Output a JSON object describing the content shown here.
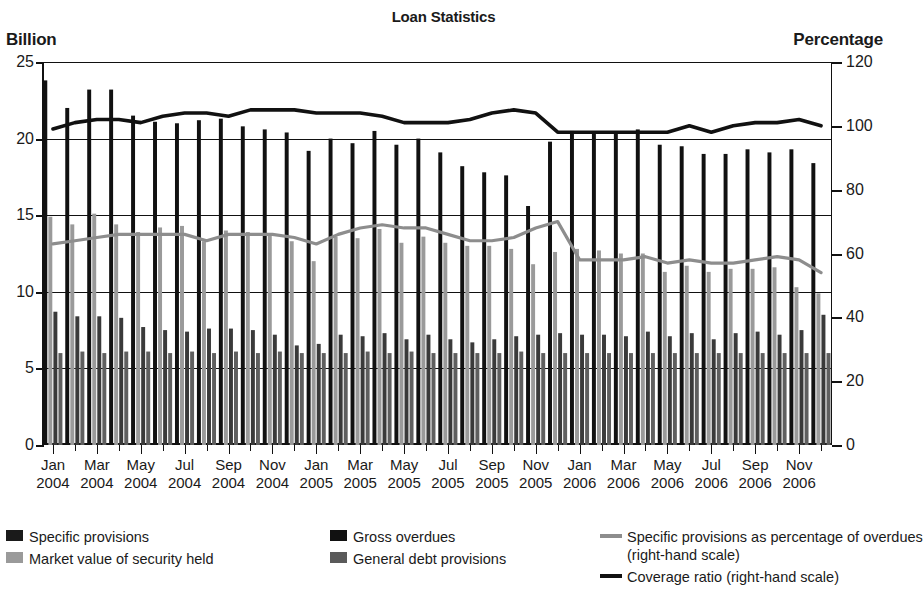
{
  "chart_title": "Loan Statistics",
  "axis_left_title": "Billion",
  "axis_right_title": "Percentage",
  "legend": {
    "items": [
      {
        "name": "specific-provisions",
        "label": "Specific provisions",
        "color": "#1a1a1a",
        "type": "swatch"
      },
      {
        "name": "market-value",
        "label": "Market value of security held",
        "color": "#9a9a9a",
        "type": "swatch"
      },
      {
        "name": "gross-overdues",
        "label": "Gross overdues",
        "color": "#111111",
        "type": "swatch"
      },
      {
        "name": "general-debt-provisions",
        "label": "General debt provisions",
        "color": "#5a5a5a",
        "type": "swatch"
      },
      {
        "name": "specific-pct-overdues",
        "label": "Specific provisions as percentage of overdues",
        "sub": "(right-hand scale)",
        "color": "#8d8d8d",
        "type": "line"
      },
      {
        "name": "coverage-ratio",
        "label": "Coverage ratio (right-hand scale)",
        "color": "#111111",
        "type": "line"
      }
    ]
  },
  "chart_data": {
    "type": "bar",
    "title": "Loan Statistics",
    "xlabel": "",
    "ylabel": "Billion",
    "y2label": "Percentage",
    "ylim": [
      0,
      25
    ],
    "y2lim": [
      0,
      120
    ],
    "yticks": [
      0,
      5,
      10,
      15,
      20,
      25
    ],
    "y2ticks": [
      0,
      20,
      40,
      60,
      80,
      100,
      120
    ],
    "grid": true,
    "legend_position": "below",
    "categories": [
      "Jan 2004",
      "Feb 2004",
      "Mar 2004",
      "Apr 2004",
      "May 2004",
      "Jun 2004",
      "Jul 2004",
      "Aug 2004",
      "Sep 2004",
      "Oct 2004",
      "Nov 2004",
      "Dec 2004",
      "Jan 2005",
      "Feb 2005",
      "Mar 2005",
      "Apr 2005",
      "May 2005",
      "Jun 2005",
      "Jul 2005",
      "Aug 2005",
      "Sep 2005",
      "Oct 2005",
      "Nov 2005",
      "Dec 2005",
      "Jan 2006",
      "Feb 2006",
      "Mar 2006",
      "Apr 2006",
      "May 2006",
      "Jun 2006",
      "Jul 2006",
      "Aug 2006",
      "Sep 2006",
      "Oct 2006",
      "Nov 2006",
      "Dec 2006"
    ],
    "tick_labels": [
      {
        "index": 0,
        "month": "Jan",
        "year": "2004"
      },
      {
        "index": 2,
        "month": "Mar",
        "year": "2004"
      },
      {
        "index": 4,
        "month": "May",
        "year": "2004"
      },
      {
        "index": 6,
        "month": "Jul",
        "year": "2004"
      },
      {
        "index": 8,
        "month": "Sep",
        "year": "2004"
      },
      {
        "index": 10,
        "month": "Nov",
        "year": "2004"
      },
      {
        "index": 12,
        "month": "Jan",
        "year": "2005"
      },
      {
        "index": 14,
        "month": "Mar",
        "year": "2005"
      },
      {
        "index": 16,
        "month": "May",
        "year": "2005"
      },
      {
        "index": 18,
        "month": "Jul",
        "year": "2005"
      },
      {
        "index": 20,
        "month": "Sep",
        "year": "2005"
      },
      {
        "index": 22,
        "month": "Nov",
        "year": "2005"
      },
      {
        "index": 24,
        "month": "Jan",
        "year": "2006"
      },
      {
        "index": 26,
        "month": "Mar",
        "year": "2006"
      },
      {
        "index": 28,
        "month": "May",
        "year": "2006"
      },
      {
        "index": 30,
        "month": "Jul",
        "year": "2006"
      },
      {
        "index": 32,
        "month": "Sep",
        "year": "2006"
      },
      {
        "index": 34,
        "month": "Nov",
        "year": "2006"
      }
    ],
    "series": [
      {
        "name": "Gross overdues",
        "axis": "left",
        "kind": "bar",
        "color": "#111111",
        "values": [
          23.8,
          22.0,
          23.2,
          23.2,
          21.5,
          21.1,
          21.0,
          21.2,
          21.3,
          20.8,
          20.6,
          20.4,
          19.2,
          20.0,
          19.7,
          20.5,
          19.6,
          20.0,
          19.1,
          18.2,
          17.8,
          17.6,
          15.6,
          19.8,
          20.5,
          20.4,
          20.3,
          20.6,
          19.6,
          19.5,
          19.0,
          19.0,
          19.3,
          19.1,
          19.3,
          18.4
        ]
      },
      {
        "name": "Market value of security held",
        "axis": "left",
        "kind": "bar",
        "color": "#9a9a9a",
        "values": [
          14.9,
          14.4,
          15.1,
          14.4,
          13.9,
          14.2,
          14.3,
          13.3,
          14.0,
          13.9,
          13.8,
          13.3,
          12.0,
          13.6,
          13.5,
          14.1,
          13.2,
          13.6,
          13.2,
          13.0,
          13.0,
          12.8,
          11.8,
          12.6,
          12.8,
          12.7,
          12.5,
          12.5,
          11.3,
          11.7,
          11.3,
          11.5,
          11.5,
          11.6,
          10.3,
          9.9
        ]
      },
      {
        "name": "Specific provisions",
        "axis": "left",
        "kind": "bar",
        "color": "#3a3a3a",
        "values": [
          8.7,
          8.4,
          8.4,
          8.3,
          7.7,
          7.5,
          7.4,
          7.6,
          7.6,
          7.5,
          7.2,
          6.5,
          6.6,
          7.2,
          7.1,
          7.3,
          6.9,
          7.2,
          6.9,
          6.7,
          6.9,
          7.1,
          7.2,
          7.3,
          7.2,
          7.2,
          7.1,
          7.4,
          7.1,
          7.3,
          6.9,
          7.3,
          7.4,
          7.2,
          7.5,
          8.5
        ]
      },
      {
        "name": "General debt provisions",
        "axis": "left",
        "kind": "bar",
        "color": "#5f5f5f",
        "values": [
          6.0,
          6.1,
          6.0,
          6.1,
          6.1,
          6.0,
          6.1,
          6.0,
          6.1,
          6.0,
          6.1,
          6.0,
          6.0,
          6.0,
          6.1,
          6.0,
          6.1,
          6.0,
          6.0,
          6.0,
          6.0,
          6.1,
          6.0,
          6.0,
          6.0,
          6.0,
          6.0,
          6.0,
          6.0,
          6.0,
          6.0,
          6.0,
          6.0,
          6.0,
          6.0,
          6.0
        ]
      },
      {
        "name": "Specific provisions as percentage of overdues",
        "axis": "right",
        "kind": "line",
        "color": "#8d8d8d",
        "values": [
          63,
          64,
          65,
          66,
          66,
          66,
          66,
          64,
          66,
          66,
          66,
          65,
          63,
          66,
          68,
          69,
          68,
          68,
          66,
          64,
          64,
          65,
          68,
          70,
          58,
          58,
          58,
          59,
          57,
          58,
          57,
          57,
          58,
          59,
          58,
          54
        ]
      },
      {
        "name": "Coverage ratio",
        "axis": "right",
        "kind": "line",
        "color": "#111111",
        "values": [
          99,
          101,
          102,
          102,
          101,
          103,
          104,
          104,
          103,
          105,
          105,
          105,
          104,
          104,
          104,
          103,
          101,
          101,
          101,
          102,
          104,
          105,
          104,
          98,
          98,
          98,
          98,
          98,
          98,
          100,
          98,
          100,
          101,
          101,
          102,
          100
        ]
      }
    ]
  }
}
